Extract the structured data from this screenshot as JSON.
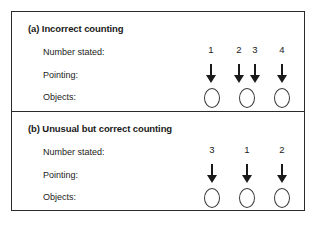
{
  "figure": {
    "background_color": "#ffffff",
    "border_color": "#2b2b2b",
    "ink_color": "#1a1a1a"
  },
  "row_labels": {
    "number_stated": "Number stated:",
    "pointing": "Pointing:",
    "objects": "Objects:"
  },
  "panels": [
    {
      "id": "panel-a",
      "title": "(a) Incorrect counting",
      "numbers": [
        {
          "label": "1",
          "x": 210
        },
        {
          "label": "2",
          "x": 238
        },
        {
          "label": "3",
          "x": 254
        },
        {
          "label": "4",
          "x": 281
        }
      ],
      "arrows": [
        {
          "name": "down-arrow-icon",
          "x": 210
        },
        {
          "name": "down-arrow-icon",
          "x": 238
        },
        {
          "name": "down-arrow-icon",
          "x": 254
        },
        {
          "name": "down-arrow-icon",
          "x": 281
        }
      ],
      "objects": [
        {
          "name": "oval-object",
          "x": 211
        },
        {
          "name": "oval-object",
          "x": 246
        },
        {
          "name": "oval-object",
          "x": 281
        }
      ]
    },
    {
      "id": "panel-b",
      "title": "(b) Unusual but correct counting",
      "numbers": [
        {
          "label": "3",
          "x": 211
        },
        {
          "label": "1",
          "x": 246
        },
        {
          "label": "2",
          "x": 281
        }
      ],
      "arrows": [
        {
          "name": "down-arrow-icon",
          "x": 211
        },
        {
          "name": "down-arrow-icon",
          "x": 246
        },
        {
          "name": "down-arrow-icon",
          "x": 281
        }
      ],
      "objects": [
        {
          "name": "oval-object",
          "x": 211
        },
        {
          "name": "oval-object",
          "x": 246
        },
        {
          "name": "oval-object",
          "x": 281
        }
      ]
    }
  ]
}
